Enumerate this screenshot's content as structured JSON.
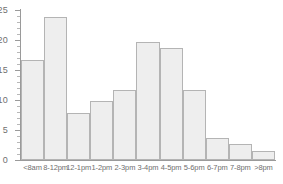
{
  "chart_data": {
    "type": "bar",
    "title": "",
    "subtitle": "",
    "xlabel": "",
    "ylabel": "",
    "categories": [
      "<8am",
      "8-12pm",
      "12-1pm",
      "1-2pm",
      "2-3pm",
      "3-4pm",
      "4-5pm",
      "5-6pm",
      "6-7pm",
      "7-8pm",
      ">8pm"
    ],
    "values": [
      16.7,
      23.8,
      7.8,
      9.9,
      11.7,
      19.6,
      18.6,
      11.7,
      3.7,
      2.6,
      1.5
    ],
    "ylim": [
      0,
      25
    ],
    "y_ticks": [
      0,
      5,
      10,
      15,
      20,
      25
    ],
    "y_tick_labels": [
      "0",
      "5",
      "10",
      "15",
      "20",
      "25"
    ],
    "y_minor_tick_step": 1,
    "grid": false,
    "legend": null,
    "legend_position": "none",
    "bar_fill_color": "#eeeeee",
    "bar_border_color": "#b4b4b4",
    "axis_color": "#9a9a9a",
    "tick_label_color": "#6f6f6f",
    "background_color": "#ffffff"
  }
}
